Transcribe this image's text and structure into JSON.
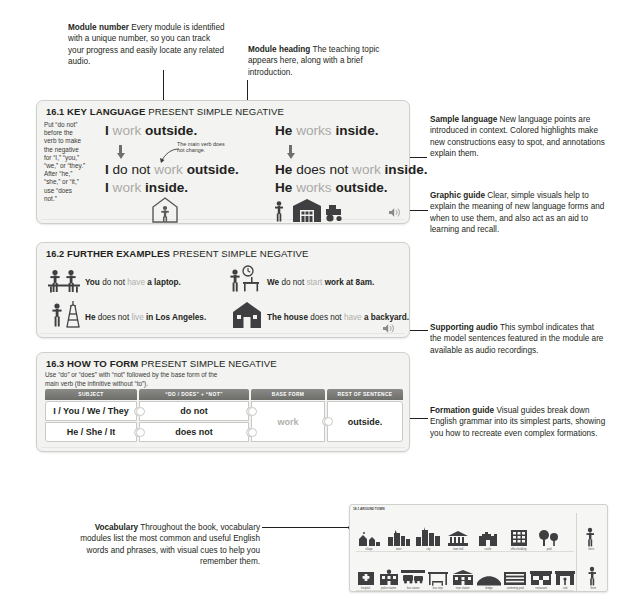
{
  "annotations": {
    "module_number": {
      "term": "Module number",
      "body": " Every module is identified with a unique number, so you can track your progress and easily locate any related audio."
    },
    "module_heading": {
      "term": "Module heading",
      "body": " The teaching topic appears here, along with a brief introduction."
    },
    "sample_language": {
      "term": "Sample language",
      "body": " New language points are introduced in context. Colored highlights make new constructions easy to spot, and annotations explain them."
    },
    "graphic_guide": {
      "term": "Graphic guide",
      "body": " Clear, simple visuals help to explain the meaning of new language forms and when to use them, and also act as an aid to learning and recall."
    },
    "supporting_audio": {
      "term": "Supporting audio",
      "body": " This symbol indicates that the model sentences featured in the module are available as audio recordings."
    },
    "formation_guide": {
      "term": "Formation guide",
      "body": " Visual guides break down English grammar into its simplest parts, showing you how to recreate even complex formations."
    },
    "vocabulary": {
      "term": "Vocabulary",
      "body": " Throughout the book, vocabulary modules list the most common and useful English words and phrases, with visual cues to help you remember them."
    }
  },
  "module_key_language": {
    "number": "16.1",
    "title": "KEY LANGUAGE",
    "subtitle": "PRESENT SIMPLE NEGATIVE",
    "note": "Put “do not” before the verb to make the negative for “I,” “you,” “we,” or “they.” After “he,” “she,” or “it,” use “does not.”",
    "annotation": "The main verb does not change.",
    "audio_icon": "speaker-icon",
    "sentences": [
      {
        "parts": [
          {
            "t": "I ",
            "s": "b"
          },
          {
            "t": "work ",
            "s": "g"
          },
          {
            "t": "outside.",
            "s": "b"
          }
        ]
      },
      {
        "parts": [
          {
            "t": "I ",
            "s": "b"
          },
          {
            "t": "do not ",
            "s": "n"
          },
          {
            "t": "work ",
            "s": "g"
          },
          {
            "t": "outside.",
            "s": "b"
          }
        ]
      },
      {
        "parts": [
          {
            "t": "I ",
            "s": "b"
          },
          {
            "t": "work ",
            "s": "g"
          },
          {
            "t": "inside.",
            "s": "b"
          }
        ]
      },
      {
        "parts": [
          {
            "t": "He ",
            "s": "b"
          },
          {
            "t": "works ",
            "s": "g"
          },
          {
            "t": "inside.",
            "s": "b"
          }
        ]
      },
      {
        "parts": [
          {
            "t": "He ",
            "s": "b"
          },
          {
            "t": "does not ",
            "s": "n"
          },
          {
            "t": "work ",
            "s": "g"
          },
          {
            "t": "inside.",
            "s": "b"
          }
        ]
      },
      {
        "parts": [
          {
            "t": "He ",
            "s": "b"
          },
          {
            "t": "works ",
            "s": "g"
          },
          {
            "t": "outside.",
            "s": "b"
          }
        ]
      }
    ]
  },
  "module_further_examples": {
    "number": "16.2",
    "title": "FURTHER EXAMPLES",
    "subtitle": "PRESENT SIMPLE NEGATIVE",
    "audio_icon": "speaker-icon",
    "examples": [
      {
        "icon": "people-table-icon",
        "parts": [
          {
            "t": "You ",
            "s": "b"
          },
          {
            "t": "do not ",
            "s": "n"
          },
          {
            "t": "have ",
            "s": "g"
          },
          {
            "t": "a laptop.",
            "s": "b"
          }
        ]
      },
      {
        "icon": "clock-desk-icon",
        "parts": [
          {
            "t": "We ",
            "s": "b"
          },
          {
            "t": "do not ",
            "s": "n"
          },
          {
            "t": "start ",
            "s": "g"
          },
          {
            "t": "work at 8am.",
            "s": "b"
          }
        ]
      },
      {
        "icon": "eiffel-tower-icon",
        "parts": [
          {
            "t": "He ",
            "s": "b"
          },
          {
            "t": "does not ",
            "s": "n"
          },
          {
            "t": "live ",
            "s": "g"
          },
          {
            "t": "in Los Angeles.",
            "s": "b"
          }
        ]
      },
      {
        "icon": "house-icon",
        "parts": [
          {
            "t": "The house ",
            "s": "b"
          },
          {
            "t": "does not ",
            "s": "n"
          },
          {
            "t": "have ",
            "s": "g"
          },
          {
            "t": "a backyard.",
            "s": "b"
          }
        ]
      }
    ]
  },
  "module_how_to_form": {
    "number": "16.3",
    "title": "HOW TO FORM",
    "subtitle": "PRESENT SIMPLE NEGATIVE",
    "note": "Use “do” or “does” with “not” followed by the base form of the main verb (the infinitive without “to”).",
    "headers": [
      "SUBJECT",
      "“DO / DOES” + “NOT”",
      "BASE FORM",
      "REST OF SENTENCE"
    ],
    "rows": [
      {
        "subject": "I / You / We / They",
        "aux": "do not"
      },
      {
        "subject": "He / She / It",
        "aux": "does not"
      }
    ],
    "base_form": "work",
    "rest_of_sentence": "outside."
  },
  "vocab_thumb": {
    "number": "18.1",
    "title": "AROUND TOWN",
    "row1": [
      {
        "icon": "village-icon",
        "caption": "village"
      },
      {
        "icon": "town-icon",
        "caption": "town"
      },
      {
        "icon": "city-icon",
        "caption": "city"
      },
      {
        "icon": "townhall-icon",
        "caption": "town hall"
      },
      {
        "icon": "castle-icon",
        "caption": "castle"
      },
      {
        "icon": "office-building-icon",
        "caption": "office building"
      },
      {
        "icon": "park-icon",
        "caption": "park"
      },
      {
        "icon": "man-icon",
        "caption": "there"
      }
    ],
    "row2": [
      {
        "icon": "hospital-icon",
        "caption": "hospital"
      },
      {
        "icon": "police-station-icon",
        "caption": "police station"
      },
      {
        "icon": "bus-station-icon",
        "caption": "bus station"
      },
      {
        "icon": "bus-stop-icon",
        "caption": "bus stop"
      },
      {
        "icon": "train-station-icon",
        "caption": "train station"
      },
      {
        "icon": "bridge-icon",
        "caption": "bridge"
      },
      {
        "icon": "swimming-pool-icon",
        "caption": "swimming pool"
      },
      {
        "icon": "restaurant-icon",
        "caption": "restaurant"
      },
      {
        "icon": "cafe-icon",
        "caption": "cafe"
      },
      {
        "icon": "person-icon",
        "caption": "there"
      }
    ]
  },
  "colors": {
    "page_bg": "#ffffff",
    "card_bg": "#f3f3f1",
    "card_border": "#cfcfcb",
    "text": "#231f20",
    "highlight_grey": "#a9a9a6",
    "header_bar": "#7b7b78"
  }
}
